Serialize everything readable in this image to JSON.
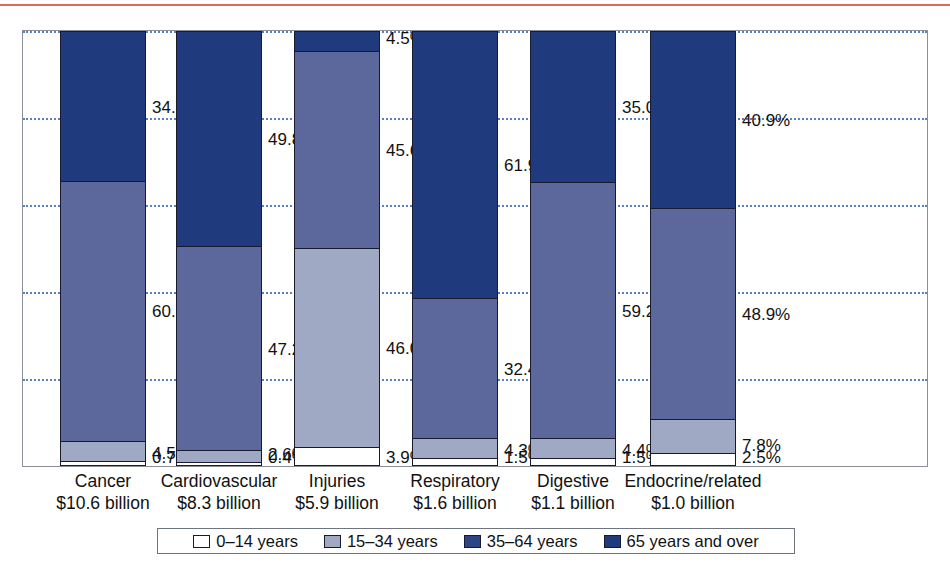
{
  "decor": {
    "top_rule_color": "#e06a5a"
  },
  "chart_data": {
    "type": "bar",
    "subtype": "stacked-100-percent",
    "title": "",
    "subtitle": "",
    "xlabel": "",
    "ylabel": "",
    "ylim": [
      0,
      100
    ],
    "grid": true,
    "gridlines": [
      20,
      40,
      60,
      80,
      100
    ],
    "legend_position": "bottom",
    "categories": [
      "Cancer",
      "Cardiovascular",
      "Injuries",
      "Respiratory",
      "Digestive",
      "Endocrine/related"
    ],
    "category_amounts": [
      "$10.6 billion",
      "$8.3 billion",
      "$5.9 billion",
      "$1.6 billion",
      "$1.1 billion",
      "$1.0 billion"
    ],
    "series": [
      {
        "name": "0–14 years",
        "color": "#ffffff",
        "values": [
          0.7,
          0.4,
          3.9,
          1.5,
          1.5,
          2.5
        ],
        "labels": [
          "0.7%",
          "0.4%",
          "3.9%",
          "1.5%",
          "1.5%",
          "2.5%"
        ]
      },
      {
        "name": "15–34 years",
        "color": "#9fa9c3",
        "values": [
          4.5,
          2.6,
          46.0,
          4.3,
          4.4,
          7.8
        ],
        "labels": [
          "4.5%",
          "2.6%",
          "46.0%",
          "4.3%",
          "4.4%",
          "7.8%"
        ]
      },
      {
        "name": "35–64 years",
        "color": "#5c689c",
        "values": [
          60.1,
          47.2,
          45.6,
          32.4,
          59.2,
          48.9
        ],
        "labels": [
          "60.1%",
          "47.2%",
          "45.6%",
          "32.4%",
          "59.2%",
          "48.9%"
        ]
      },
      {
        "name": "65 years and over",
        "color": "#1f3a7d",
        "values": [
          34.7,
          49.8,
          4.5,
          61.9,
          35.0,
          40.9
        ],
        "labels": [
          "34.7%",
          "49.8%",
          "4.5%",
          "61.9%",
          "35.0%",
          "40.9%"
        ]
      }
    ]
  },
  "legend": {
    "items": [
      {
        "label": "0–14 years",
        "color": "#ffffff"
      },
      {
        "label": "15–34 years",
        "color": "#9fa9c3"
      },
      {
        "label": "35–64 years",
        "color": "#2f4484"
      },
      {
        "label": "65 years and over",
        "color": "#1f3a7d"
      }
    ]
  }
}
